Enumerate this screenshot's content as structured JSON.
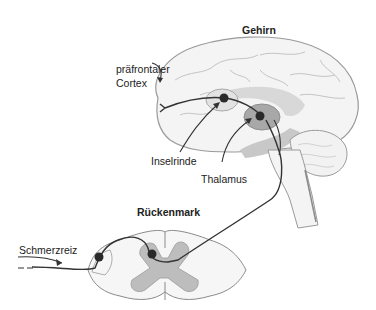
{
  "diagram": {
    "type": "pain-pathway",
    "titles": {
      "brain": "Gehirn",
      "spinal_cord": "Rückenmark"
    },
    "labels": {
      "prefrontal_line1": "präfrontaler",
      "prefrontal_line2": "Cortex",
      "insula": "Inselrinde",
      "thalamus": "Thalamus",
      "stimulus": "Schmerzreiz"
    },
    "colors": {
      "outline": "#9a9a9a",
      "gray_matter": "#bdbdbd",
      "thalamus_fill": "#a8a8a8",
      "limbic_fill": "#d6d6d6",
      "pathway": "#333333",
      "neuron": "#2a2a2a"
    }
  }
}
